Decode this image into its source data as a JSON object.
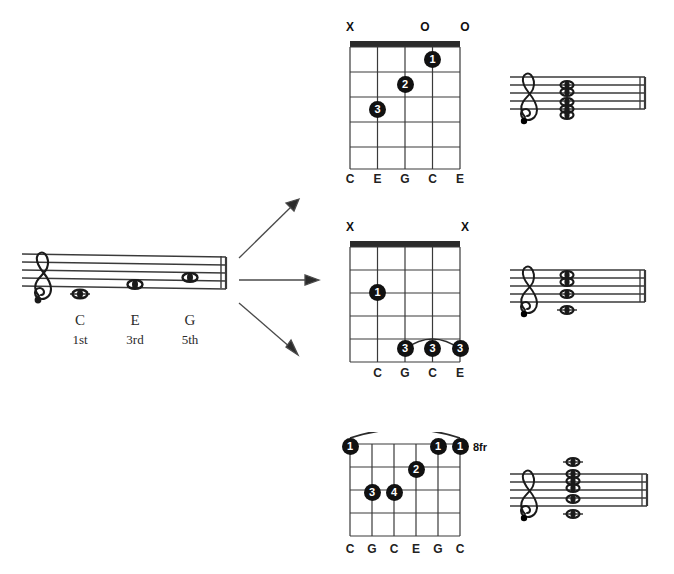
{
  "source": {
    "label": "C-major-triad-source-staff",
    "clef": "treble-clef",
    "notes": [
      {
        "name": "C",
        "degree": "1st"
      },
      {
        "name": "E",
        "degree": "3rd"
      },
      {
        "name": "G",
        "degree": "5th"
      }
    ]
  },
  "arrows": [
    {
      "name": "arrow-to-open-c-voicing",
      "direction": "up-right"
    },
    {
      "name": "arrow-to-mid-c-voicing",
      "direction": "right"
    },
    {
      "name": "arrow-to-barre-c-voicing",
      "direction": "down-right"
    }
  ],
  "voicings": [
    {
      "id": "open-c",
      "position_label": "",
      "strings": 5,
      "frets": 5,
      "has_nut": true,
      "open_marks": [
        "X",
        "",
        "",
        "O",
        "O"
      ],
      "notes": [
        "C",
        "E",
        "G",
        "C",
        "E"
      ],
      "dots": [
        {
          "finger": "1",
          "string": 4,
          "fret": 1
        },
        {
          "finger": "2",
          "string": 2,
          "fret": 2
        },
        {
          "finger": "3",
          "string": 1,
          "fret": 3
        }
      ],
      "barre": null
    },
    {
      "id": "mid-c",
      "position_label": "",
      "strings": 5,
      "frets": 5,
      "has_nut": true,
      "open_marks": [
        "X",
        "",
        "",
        "",
        "X"
      ],
      "notes": [
        "",
        "C",
        "G",
        "C",
        "E"
      ],
      "dots": [
        {
          "finger": "1",
          "string": 1,
          "fret": 3
        },
        {
          "finger": "3",
          "string": 2,
          "fret": 5
        },
        {
          "finger": "3",
          "string": 3,
          "fret": 5
        },
        {
          "finger": "3",
          "string": 4,
          "fret": 5
        }
      ],
      "barre": {
        "from_string": 2,
        "to_string": 4,
        "fret": 5
      }
    },
    {
      "id": "barre-c-8fr",
      "position_label": "8fr",
      "strings": 6,
      "frets": 5,
      "has_nut": false,
      "open_marks": [
        "",
        "",
        "",
        "",
        "",
        ""
      ],
      "notes": [
        "C",
        "G",
        "C",
        "E",
        "G",
        "C"
      ],
      "dots": [
        {
          "finger": "1",
          "string": 0,
          "fret": 1
        },
        {
          "finger": "1",
          "string": 4,
          "fret": 1
        },
        {
          "finger": "1",
          "string": 5,
          "fret": 1
        },
        {
          "finger": "2",
          "string": 3,
          "fret": 2
        },
        {
          "finger": "3",
          "string": 1,
          "fret": 3
        },
        {
          "finger": "4",
          "string": 2,
          "fret": 3
        }
      ],
      "barre": {
        "from_string": 0,
        "to_string": 5,
        "fret": 1
      }
    }
  ],
  "staves": [
    {
      "id": "stave-open-c",
      "clef": "treble-clef",
      "note_count": 5,
      "pitches": [
        "C",
        "E",
        "G",
        "C",
        "E"
      ]
    },
    {
      "id": "stave-mid-c",
      "clef": "treble-clef",
      "note_count": 4,
      "pitches": [
        "C",
        "G",
        "C",
        "E"
      ]
    },
    {
      "id": "stave-barre-c",
      "clef": "treble-clef",
      "note_count": 6,
      "pitches": [
        "C",
        "G",
        "C",
        "E",
        "G",
        "C"
      ]
    }
  ],
  "colors": {
    "ink": "#111111",
    "staff_line": "#3a3a3a",
    "dot_fill": "#111111",
    "dot_text": "#ffffff"
  }
}
